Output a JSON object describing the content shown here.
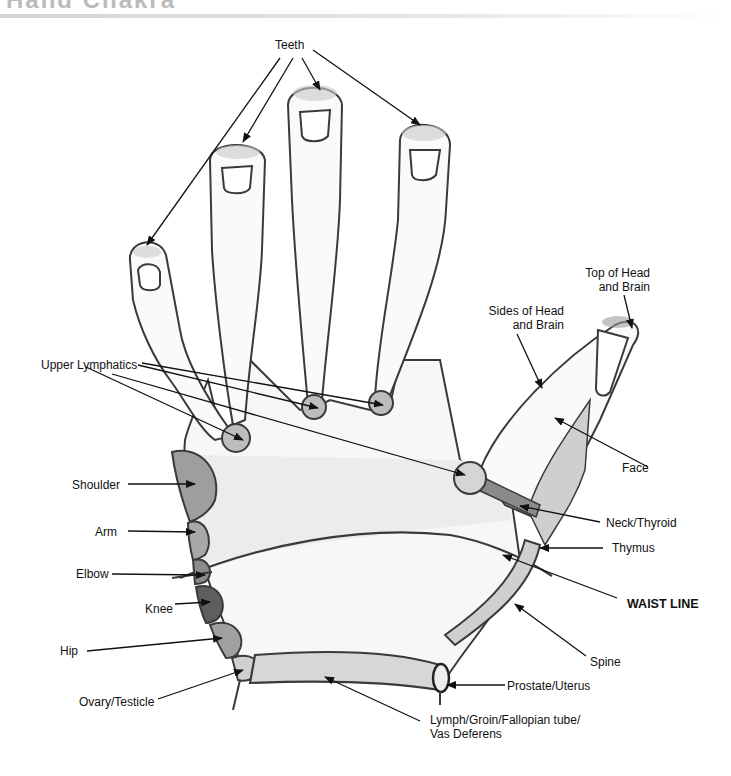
{
  "header": {
    "title": "Hand Chakra"
  },
  "diagram": {
    "type": "hand reflexology / correspondence map",
    "labels": {
      "teeth": "Teeth",
      "top_of_head_1": "Top of Head",
      "top_of_head_2": "and Brain",
      "sides_of_head_1": "Sides of Head",
      "sides_of_head_2": "and Brain",
      "upper_lymphatics": "Upper Lymphatics",
      "face": "Face",
      "shoulder": "Shoulder",
      "arm": "Arm",
      "neck_thyroid": "Neck/Thyroid",
      "elbow": "Elbow",
      "thymus": "Thymus",
      "knee": "Knee",
      "waist_line": "WAIST LINE",
      "hip": "Hip",
      "spine": "Spine",
      "prostate_uterus": "Prostate/Uterus",
      "ovary_testicle": "Ovary/Testicle",
      "lymph_1": "Lymph/Groin/Fallopian tube/",
      "lymph_2": "Vas Deferens"
    },
    "colors": {
      "outline": "#3a3a3a",
      "light_fill": "#e6e6e6",
      "mid_fill": "#bdbdbd",
      "dark_fill": "#8a8a8a",
      "darkest_fill": "#5e5e5e",
      "arrow": "#111111"
    }
  }
}
